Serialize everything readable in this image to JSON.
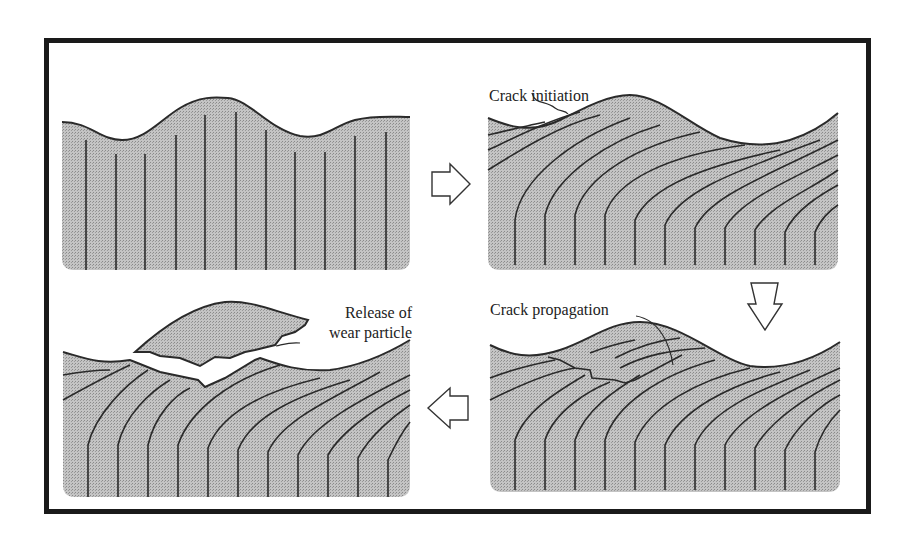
{
  "figure": {
    "panels": [
      {
        "id": "initial-surface",
        "label": ""
      },
      {
        "id": "crack-initiation",
        "label": "Crack initiation"
      },
      {
        "id": "crack-propagation",
        "label": "Crack propagation"
      },
      {
        "id": "particle-release",
        "label_line1": "Release of",
        "label_line2": "wear particle"
      }
    ],
    "arrows": [
      {
        "direction": "right",
        "from": "initial-surface",
        "to": "crack-initiation"
      },
      {
        "direction": "down",
        "from": "crack-initiation",
        "to": "crack-propagation"
      },
      {
        "direction": "left",
        "from": "crack-propagation",
        "to": "particle-release"
      }
    ],
    "colors": {
      "fill": "#b8b8b8",
      "line": "#2a2a2a",
      "border": "#1a1a1a"
    }
  }
}
